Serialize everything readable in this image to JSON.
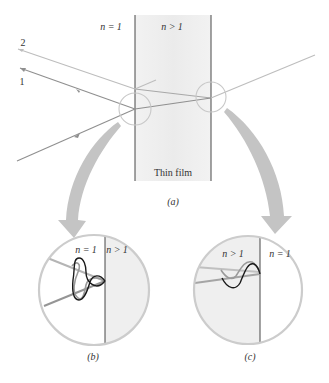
{
  "figure": {
    "panel_a": {
      "label": "(a)",
      "left_medium": "n = 1",
      "film_medium": "n > 1",
      "film_label": "Thin film",
      "rays": [
        {
          "name": "ray-1",
          "label": "1"
        },
        {
          "name": "ray-2",
          "label": "2"
        }
      ]
    },
    "panel_b": {
      "label": "(b)",
      "left_medium": "n = 1",
      "right_medium": "n > 1"
    },
    "panel_c": {
      "label": "(c)",
      "left_medium": "n > 1",
      "right_medium": "n = 1"
    },
    "colors": {
      "film_fill": "#ededed",
      "ray_dark": "#8a8a8a",
      "ray_light": "#b8b8b8",
      "circle": "#c8c8c8",
      "arrow": "#c4c4c4",
      "wave": "#1a1a1a",
      "boundary": "#333333"
    }
  }
}
